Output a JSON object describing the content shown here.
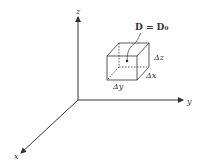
{
  "diagram": {
    "axes": {
      "x_label": "x",
      "y_label": "y",
      "z_label": "z"
    },
    "equation": "D = D₀",
    "deltas": {
      "dx": "Δx",
      "dy": "Δy",
      "dz": "Δz"
    },
    "colors": {
      "line": "#333333",
      "background": "#ffffff"
    }
  }
}
